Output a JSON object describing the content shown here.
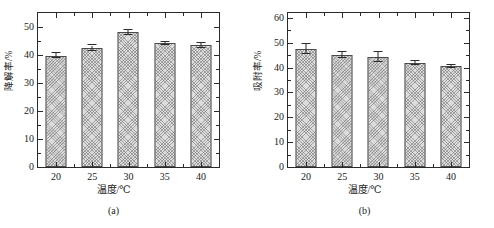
{
  "figure": {
    "panels": [
      {
        "id": "panel-a",
        "caption": "(a)",
        "chart_data": {
          "type": "bar",
          "title": "",
          "xlabel": "温度/℃",
          "ylabel": "降解率/%",
          "categories": [
            "20",
            "25",
            "30",
            "35",
            "40"
          ],
          "values": [
            39.8,
            42.5,
            48.2,
            44.2,
            43.4
          ],
          "errors": [
            0.8,
            0.9,
            0.9,
            0.5,
            0.9
          ],
          "ylim": [
            0,
            55
          ],
          "yticks": [
            0,
            10,
            20,
            30,
            40,
            50
          ],
          "ytick_labels": [
            "0",
            "10",
            "20",
            "30",
            "40",
            "50"
          ],
          "yminor_step": 5,
          "grid": false,
          "legend": false
        }
      },
      {
        "id": "panel-b",
        "caption": "(b)",
        "chart_data": {
          "type": "bar",
          "title": "",
          "xlabel": "温度/℃",
          "ylabel": "吸附率/%",
          "categories": [
            "20",
            "25",
            "30",
            "35",
            "40"
          ],
          "values": [
            47.5,
            45.1,
            44.3,
            41.8,
            40.5
          ],
          "errors": [
            2.1,
            1.1,
            2.2,
            0.8,
            0.5
          ],
          "ylim": [
            0,
            62
          ],
          "yticks": [
            0,
            10,
            20,
            30,
            40,
            50,
            60
          ],
          "ytick_labels": [
            "0",
            "10",
            "20",
            "30",
            "40",
            "50",
            "60"
          ],
          "yminor_step": 5,
          "grid": false,
          "legend": false
        }
      }
    ]
  }
}
